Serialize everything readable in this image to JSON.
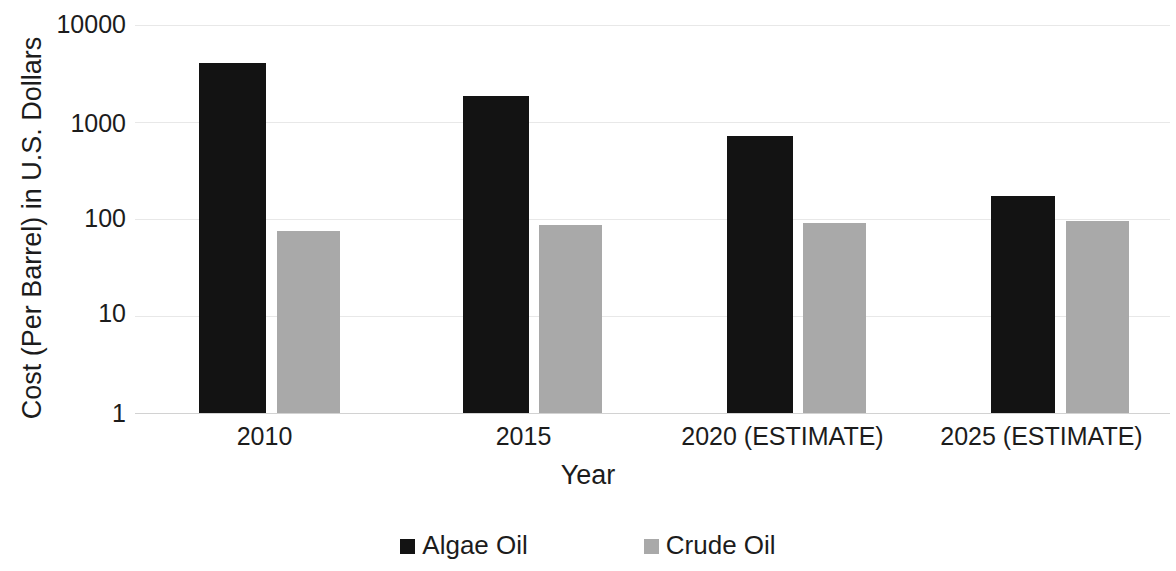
{
  "chart_data": {
    "type": "bar",
    "title": "",
    "subtitle": "",
    "xlabel": "Year",
    "ylabel": "Cost (Per Barrel) in U.S. Dollars",
    "categories": [
      "2010",
      "2015",
      "2020 (ESTIMATE)",
      "2025 (ESTIMATE)"
    ],
    "series": [
      {
        "name": "Algae Oil",
        "color": "#131313",
        "values": [
          4000,
          1800,
          700,
          170
        ]
      },
      {
        "name": "Crude Oil",
        "color": "#a9a9a9",
        "values": [
          75,
          85,
          90,
          95
        ]
      }
    ],
    "yscale": "log",
    "ylim": [
      1,
      10000
    ],
    "ytick_labels": [
      "10000",
      "1000",
      "100",
      "10",
      "1"
    ],
    "ytick_values": [
      10000,
      1000,
      100,
      10,
      1
    ],
    "grid": true,
    "grid_axis": "y",
    "legend_position": "bottom",
    "legend_entries": [
      "Algae Oil",
      "Crude Oil"
    ]
  },
  "axes": {
    "y_title": "Cost (Per Barrel) in U.S. Dollars",
    "x_title": "Year",
    "y_ticks": [
      {
        "label": "10000"
      },
      {
        "label": "1000"
      },
      {
        "label": "100"
      },
      {
        "label": "10"
      },
      {
        "label": "1"
      }
    ],
    "x_ticks": [
      {
        "label": "2010"
      },
      {
        "label": "2015"
      },
      {
        "label": "2020 (ESTIMATE)"
      },
      {
        "label": "2025 (ESTIMATE)"
      }
    ]
  },
  "legend": {
    "items": [
      {
        "label": "Algae Oil",
        "color": "#131313"
      },
      {
        "label": "Crude Oil",
        "color": "#a9a9a9"
      }
    ]
  },
  "colors": {
    "algae": "#131313",
    "crude": "#a9a9a9",
    "grid": "#e8e8e8",
    "text": "#1c1c1c",
    "background": "#ffffff"
  }
}
